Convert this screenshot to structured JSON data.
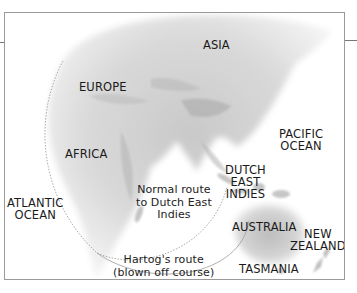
{
  "map": {
    "labels": {
      "asia": "ASIA",
      "europe": "EUROPE",
      "africa": "AFRICA",
      "pacific_ocean": "PACIFIC\nOCEAN",
      "atlantic_ocean": "ATLANTIC\nOCEAN",
      "dutch_east_indies": "DUTCH\nEAST\nINDIES",
      "australia": "AUSTRALIA",
      "new_zealand": "NEW\nZEALAND",
      "tasmania": "TASMANIA"
    },
    "routes": {
      "normal_route": "Normal route\nto Dutch East\nIndies",
      "hartog_route": "Hartog's route\n(blown off course)"
    },
    "colors": {
      "land_light": "#e6e6e6",
      "land_mid": "#cfcfcf",
      "land_dark": "#b4b4b4",
      "route_line": "#9a9a9a",
      "frame": "#9a9a9a",
      "text": "#1a1a1a"
    }
  }
}
